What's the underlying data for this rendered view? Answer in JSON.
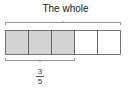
{
  "diagram": {
    "title": "The whole",
    "total_parts": 5,
    "shaded_parts": 3,
    "fraction": {
      "numerator": "3",
      "denominator": "5"
    },
    "colors": {
      "shaded": "#d3d3d3",
      "unshaded": "#ffffff",
      "stroke": "#555555"
    }
  }
}
